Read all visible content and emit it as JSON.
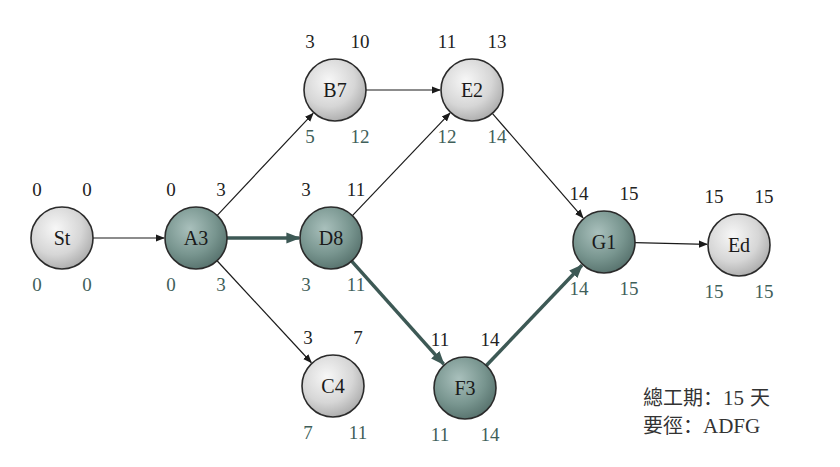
{
  "diagram": {
    "colors": {
      "critical_node": "#6f8f8b",
      "normal_node": "#d9d9d9",
      "critical_edge": "#3d5955",
      "normal_edge": "#1a1a1a",
      "top_value_text": "#222222",
      "bottom_value_text": "#3f5f5a"
    },
    "nodes": [
      {
        "id": "St",
        "label": "St",
        "x": 62,
        "y": 238,
        "es": "0",
        "ef": "0",
        "ls": "0",
        "lf": "0",
        "critical": false
      },
      {
        "id": "A3",
        "label": "A3",
        "x": 196,
        "y": 238,
        "es": "0",
        "ef": "3",
        "ls": "0",
        "lf": "3",
        "critical": true
      },
      {
        "id": "B7",
        "label": "B7",
        "x": 335,
        "y": 90,
        "es": "3",
        "ef": "10",
        "ls": "5",
        "lf": "12",
        "critical": false
      },
      {
        "id": "D8",
        "label": "D8",
        "x": 331,
        "y": 238,
        "es": "3",
        "ef": "11",
        "ls": "3",
        "lf": "11",
        "critical": true
      },
      {
        "id": "C4",
        "label": "C4",
        "x": 333,
        "y": 386,
        "es": "3",
        "ef": "7",
        "ls": "7",
        "lf": "11",
        "critical": false
      },
      {
        "id": "E2",
        "label": "E2",
        "x": 472,
        "y": 90,
        "es": "11",
        "ef": "13",
        "ls": "12",
        "lf": "14",
        "critical": false
      },
      {
        "id": "F3",
        "label": "F3",
        "x": 465,
        "y": 388,
        "es": "11",
        "ef": "14",
        "ls": "11",
        "lf": "14",
        "critical": true
      },
      {
        "id": "G1",
        "label": "G1",
        "x": 604,
        "y": 242,
        "es": "14",
        "ef": "15",
        "ls": "14",
        "lf": "15",
        "critical": true
      },
      {
        "id": "Ed",
        "label": "Ed",
        "x": 739,
        "y": 245,
        "es": "15",
        "ef": "15",
        "ls": "15",
        "lf": "15",
        "critical": false
      }
    ],
    "edges": [
      {
        "from": "St",
        "to": "A3",
        "critical": false
      },
      {
        "from": "A3",
        "to": "B7",
        "critical": false
      },
      {
        "from": "A3",
        "to": "D8",
        "critical": true
      },
      {
        "from": "A3",
        "to": "C4",
        "critical": false
      },
      {
        "from": "B7",
        "to": "E2",
        "critical": false
      },
      {
        "from": "D8",
        "to": "E2",
        "critical": false
      },
      {
        "from": "D8",
        "to": "F3",
        "critical": true
      },
      {
        "from": "E2",
        "to": "G1",
        "critical": false
      },
      {
        "from": "F3",
        "to": "G1",
        "critical": true
      },
      {
        "from": "G1",
        "to": "Ed",
        "critical": false
      }
    ]
  },
  "summary": {
    "total_label": "總工期：",
    "total_value": "15",
    "total_unit": " 天",
    "path_label": "要徑：",
    "path_value": "ADFG"
  }
}
